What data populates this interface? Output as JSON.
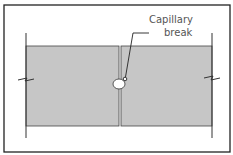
{
  "diagram": {
    "callout": {
      "line1": "Capillary",
      "line2": "break"
    },
    "colors": {
      "panel_fill": "#c6c6c6",
      "stroke": "#333333",
      "background": "#ffffff"
    }
  }
}
